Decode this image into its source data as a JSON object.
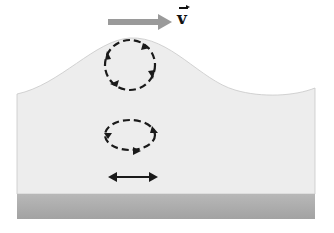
{
  "diagram": {
    "velocity_label": "v",
    "velocity_is_vector": true,
    "elements": [
      {
        "name": "wave-surface",
        "description": "Wave crest over water body"
      },
      {
        "name": "velocity-arrow",
        "description": "Gray arrow pointing right indicating wave velocity"
      },
      {
        "name": "surface-orbit",
        "description": "Circular dashed clockwise orbit near surface"
      },
      {
        "name": "mid-orbit",
        "description": "Elliptical dashed clockwise orbit at mid depth"
      },
      {
        "name": "bottom-motion",
        "description": "Double-headed horizontal arrow near bottom"
      },
      {
        "name": "sea-floor",
        "description": "Gray band representing the bottom"
      }
    ],
    "colors": {
      "water": "#ededed",
      "floor": "#a8a8a8",
      "arrow": "#9a9a9a",
      "ink": "#1a1a1a"
    }
  }
}
